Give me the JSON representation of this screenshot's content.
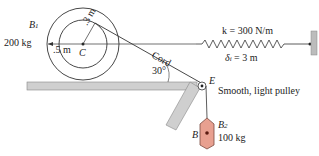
{
  "wheel": {
    "body_label": "B",
    "body_sub": "1",
    "mass": "200 kg",
    "outer_radius": ".5 m",
    "inner_radius": ".3 m",
    "center_label": "C"
  },
  "cord": {
    "label": "Cord",
    "angle": "30°"
  },
  "spring": {
    "stiffness": "k = 300 N/m",
    "initial_stretch": "δ",
    "initial_stretch_sub": "i",
    "initial_stretch_value": " = 3 m"
  },
  "pulley": {
    "label": "E",
    "description": "Smooth, light pulley"
  },
  "block": {
    "letter": "B",
    "body_label": "B",
    "body_sub": "2",
    "mass": "100 kg"
  },
  "colors": {
    "ground": "#c8c8c8",
    "block_fill": "#e8a090",
    "block_stroke": "#7a4a40",
    "wall": "#b8b8b8",
    "line": "#333333"
  }
}
